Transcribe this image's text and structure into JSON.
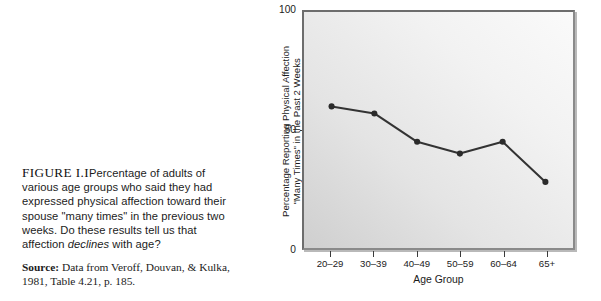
{
  "caption": {
    "figure_number": "FIGURE I.I",
    "text": "Percentage of adults of various age groups who said they had expressed physical affection toward their spouse \"many times\" in the previous two weeks. Do these results tell us that affection ",
    "italic_word": "declines",
    "text_end": " with age?",
    "source_label": "Source:",
    "source_text": " Data from Veroff, Douvan, & Kulka, 1981, Table 4.21, p. 185."
  },
  "chart_data": {
    "type": "line",
    "title": "",
    "xlabel": "Age Group",
    "ylabel_line1": "Percentage Reporting Physical Affection",
    "ylabel_line2": "\"Many Times\" in the Past 2 Weeks",
    "categories": [
      "20–29",
      "30–39",
      "40–49",
      "50–59",
      "60–64",
      "65+"
    ],
    "values": [
      60,
      57,
      45,
      40,
      45,
      28
    ],
    "ylim": [
      0,
      100
    ],
    "yticks": [
      0,
      50,
      100
    ],
    "ytick_labels": [
      "0",
      "50",
      "100"
    ],
    "grid": false,
    "legend": false,
    "line_color": "#333333",
    "marker_color": "#2b2b2b",
    "plot_bg_accent": "#d8d8d8"
  }
}
